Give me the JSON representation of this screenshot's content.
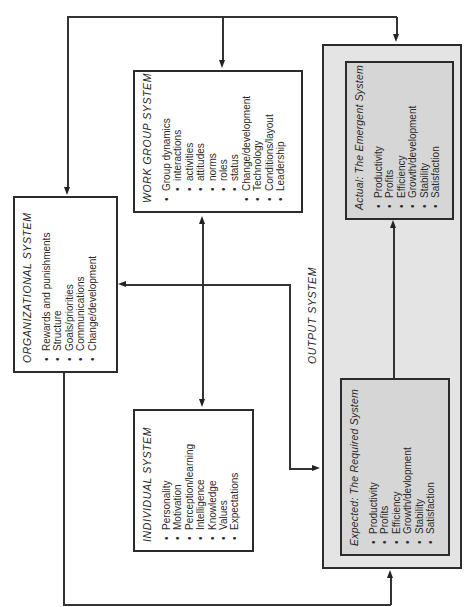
{
  "organizational_system": {
    "title": "ORGANIZATIONAL SYSTEM",
    "items": [
      "Rewards and punishments",
      "Structure",
      "Goals/priorities",
      "Communications",
      "Change/development"
    ]
  },
  "work_group_system": {
    "title": "WORK GROUP SYSTEM",
    "items": [
      {
        "label": "Group dynamics",
        "level": 0
      },
      {
        "label": "interactions",
        "level": 1
      },
      {
        "label": "activities",
        "level": 1
      },
      {
        "label": "attitudes",
        "level": 1
      },
      {
        "label": "norms",
        "level": 1
      },
      {
        "label": "roles",
        "level": 1
      },
      {
        "label": "status",
        "level": 1
      },
      {
        "label": "Change/development",
        "level": 0
      },
      {
        "label": "Technology",
        "level": 0
      },
      {
        "label": "Conditions/layout",
        "level": 0
      },
      {
        "label": "Leadership",
        "level": 0
      }
    ]
  },
  "individual_system": {
    "title": "INDIVIDUAL SYSTEM",
    "items": [
      "Personality",
      "Motivation",
      "Perception/learning",
      "Intelligence",
      "Knowledge",
      "Values",
      "Expectations"
    ]
  },
  "output_system": {
    "title": "OUTPUT SYSTEM",
    "actual": {
      "title": "Actual:  The Emergent System",
      "items": [
        "Productivity",
        "Profits",
        "Efficiency",
        "Growth/development",
        "Stability",
        "Satisfaction"
      ]
    },
    "expected": {
      "title": "Expected:  The Required System",
      "items": [
        "Productivity",
        "Profits",
        "Efficiency",
        "Growth/devlopment",
        "Stability",
        "Satisfaction"
      ]
    }
  },
  "colors": {
    "outer_fill": "#e4e4e4",
    "inner_fill": "#d6d6d6",
    "stroke": "#2b2b2b"
  }
}
